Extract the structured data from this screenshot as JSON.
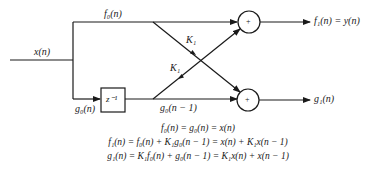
{
  "diagram": {
    "type": "lattice-filter-single-stage",
    "labels": {
      "input": "x(n)",
      "top_branch": "f₀(n)",
      "bottom_branch": "g₀(n)",
      "delay": "z⁻¹",
      "delayed": "g₀(n − 1)",
      "coef_top": "K₁",
      "coef_bottom": "K₁",
      "adder_symbol": "+",
      "output_top": "f₁(n) = y(n)",
      "output_bottom": "g₁(n)"
    },
    "equations": [
      "f₀(n) = g₀(n) = x(n)",
      "f₁(n) = f₀(n) + K₁g₀(n − 1) = x(n) + K₁x(n − 1)",
      "g₁(n) = K₁f₀(n) + g₀(n − 1) = K₁x(n) + x(n − 1)"
    ],
    "colors": {
      "stroke": "#1a1a1a",
      "background": "#ffffff"
    }
  }
}
